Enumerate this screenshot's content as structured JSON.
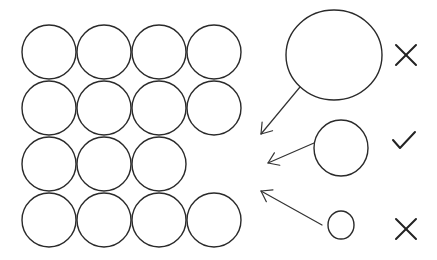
{
  "diagram": {
    "colors": {
      "stroke": "#2a2a2a",
      "background": "#ffffff"
    },
    "grid": {
      "radius": 27,
      "rows": [
        {
          "y": 52,
          "xs": [
            49,
            104,
            159,
            214
          ]
        },
        {
          "y": 108,
          "xs": [
            49,
            104,
            159,
            214
          ]
        },
        {
          "y": 164,
          "xs": [
            49,
            104,
            159
          ]
        },
        {
          "y": 220,
          "xs": [
            49,
            104,
            159,
            214
          ]
        }
      ]
    },
    "candidates": [
      {
        "id": "large",
        "cx": 334,
        "cy": 55,
        "rx": 48,
        "ry": 45,
        "verdict": "wrong",
        "mark_icon": "cross-icon",
        "mark": {
          "x": 406,
          "y": 55
        },
        "arrow": {
          "x1": 300,
          "y1": 87,
          "x2": 261,
          "y2": 134
        }
      },
      {
        "id": "medium",
        "cx": 341,
        "cy": 148,
        "rx": 27,
        "ry": 28,
        "verdict": "correct",
        "mark_icon": "check-icon",
        "mark": {
          "x": 403,
          "y": 140
        },
        "arrow": {
          "x1": 314,
          "y1": 143,
          "x2": 268,
          "y2": 163
        }
      },
      {
        "id": "small",
        "cx": 341,
        "cy": 225,
        "rx": 13,
        "ry": 14,
        "verdict": "wrong",
        "mark_icon": "cross-icon",
        "mark": {
          "x": 406,
          "y": 229
        },
        "arrow": {
          "x1": 322,
          "y1": 225,
          "x2": 261,
          "y2": 191
        }
      }
    ]
  }
}
